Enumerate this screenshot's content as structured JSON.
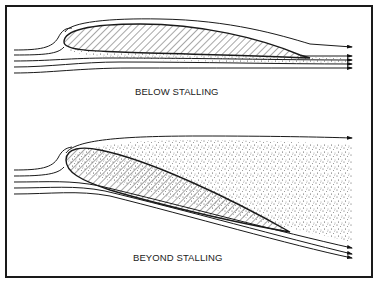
{
  "figure": {
    "panels": [
      {
        "id": "below-stalling",
        "caption": "BELOW STALLING",
        "description": "Airfoil at low angle of attack with smooth attached streamlines and thin turbulent wake"
      },
      {
        "id": "beyond-stalling",
        "caption": "BEYOND STALLING",
        "description": "Airfoil at high angle of attack with separated flow and large turbulent wake region above the upper surface"
      }
    ],
    "colors": {
      "ink": "#1a1a1a",
      "background": "#ffffff"
    }
  }
}
